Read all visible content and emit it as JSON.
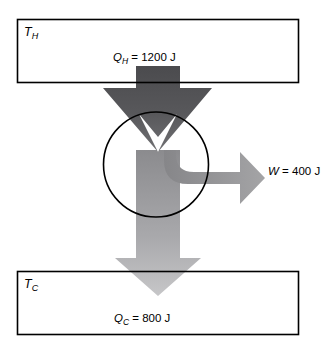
{
  "diagram": {
    "type": "heat-engine-energy-flow",
    "title": "",
    "hot_reservoir": {
      "label_symbol": "T",
      "label_subscript": "H",
      "box": {
        "x": 17,
        "y": 19,
        "width": 282,
        "height": 64
      }
    },
    "cold_reservoir": {
      "label_symbol": "T",
      "label_subscript": "C",
      "box": {
        "x": 17,
        "y": 271,
        "width": 282,
        "height": 64
      }
    },
    "engine": {
      "name": "engine-circle",
      "center_x": 156,
      "center_y": 164,
      "radius": 52
    },
    "flows": [
      {
        "name": "heat-input",
        "symbol": "Q",
        "subscript": "H",
        "equals": "=",
        "value": "1200",
        "unit": "J",
        "text": "Q_H = 1200 J",
        "direction": "down",
        "color_start": "#4f4f52",
        "color_end": "#6e6e71"
      },
      {
        "name": "work-output",
        "symbol": "W",
        "subscript": "",
        "equals": "=",
        "value": "400",
        "unit": "J",
        "text": "W = 400 J",
        "direction": "right",
        "color_start": "#8e8e90",
        "color_end": "#a0a0a2"
      },
      {
        "name": "heat-rejected",
        "symbol": "Q",
        "subscript": "C",
        "equals": "=",
        "value": "800",
        "unit": "J",
        "text": "Q_C = 800 J",
        "direction": "down",
        "color_start": "#8a8a8d",
        "color_end": "#c2c2c4"
      }
    ],
    "colors": {
      "stroke": "#000000",
      "background": "#ffffff",
      "arrow_dark": "#4f4f52",
      "arrow_mid": "#8e8e90",
      "arrow_light": "#c2c2c4"
    }
  }
}
